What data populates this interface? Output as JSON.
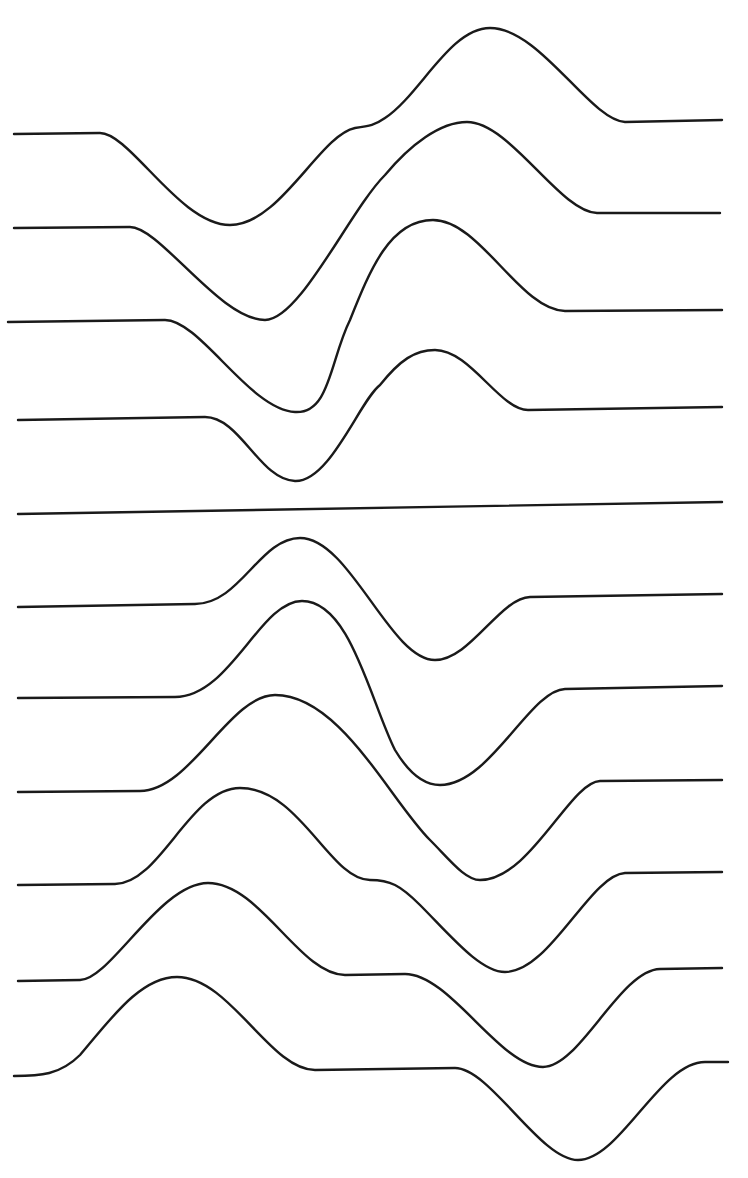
{
  "diagram": {
    "title": "",
    "background": "#ffffff",
    "stroke_color": "#1a1a1a",
    "trace_count": 11,
    "traces": [
      {
        "id": "trace-1",
        "d": "M14,134 L100,133 C130,133 180,225 230,225 C280,225 320,135 355,128 C370,126 375,125 385,118 C420,95 450,28 490,28 C540,28 590,120 625,122 L722,120"
      },
      {
        "id": "trace-2",
        "d": "M14,228 L130,227 C160,227 220,320 265,320 C300,320 350,210 385,175 C410,145 440,122 467,122 C510,122 560,212 597,213 L720,213"
      },
      {
        "id": "trace-3",
        "d": "M8,322 L165,320 C200,320 250,410 295,412 C330,414 330,360 350,320 C370,270 390,220 433,220 C480,220 520,310 565,311 L722,310"
      },
      {
        "id": "trace-4",
        "d": "M18,420 L205,417 C240,417 260,480 295,481 C330,482 360,400 380,385 C400,360 415,350 435,350 C470,350 500,410 528,410 L722,407"
      },
      {
        "id": "trace-5",
        "d": "M18,514 L722,502"
      },
      {
        "id": "trace-6",
        "d": "M18,607 L195,604 C240,604 260,538 300,538 C350,538 390,660 435,660 C470,660 500,598 530,597 L722,594"
      },
      {
        "id": "trace-7",
        "d": "M18,698 L175,697 C230,697 260,601 302,601 C350,601 370,700 395,750 C410,775 425,785 440,785 C490,785 530,690 565,689 L722,686"
      },
      {
        "id": "trace-8",
        "d": "M18,792 L140,791 C190,791 230,695 275,695 C340,695 390,800 430,840 C450,860 465,880 480,880 C530,880 570,782 600,781 L722,780"
      },
      {
        "id": "trace-9",
        "d": "M18,885 L115,884 C160,884 190,788 240,788 C300,788 330,880 370,880 C390,880 400,885 420,905 C450,935 480,972 505,972 C550,972 590,875 625,873 L722,872"
      },
      {
        "id": "trace-10",
        "d": "M18,981 L80,980 C110,980 160,883 208,883 C260,883 300,975 345,975 L405,974 C450,974 500,1067 543,1067 C580,1067 620,970 660,969 L722,968"
      },
      {
        "id": "trace-11",
        "d": "M14,1076 C40,1076 60,1075 80,1055 C110,1020 140,977 177,977 C230,977 270,1070 315,1070 L455,1068 C490,1068 540,1160 578,1160 C620,1160 660,1062 705,1062 L728,1062"
      }
    ]
  }
}
